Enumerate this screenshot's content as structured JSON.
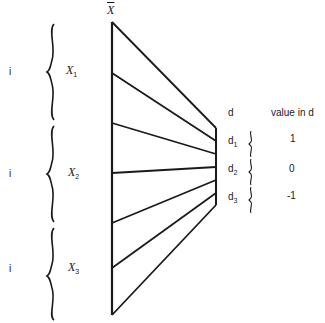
{
  "diagram": {
    "top_label": "X",
    "left_groups": [
      {
        "index_label": "i",
        "name": "X",
        "subscript": "1"
      },
      {
        "index_label": "i",
        "name": "X",
        "subscript": "2"
      },
      {
        "index_label": "i",
        "name": "X",
        "subscript": "3"
      }
    ],
    "right": {
      "header_d": "d",
      "header_value": "value in d",
      "rows": [
        {
          "name": "d",
          "subscript": "1",
          "value": "1"
        },
        {
          "name": "d",
          "subscript": "2",
          "value": "0"
        },
        {
          "name": "d",
          "subscript": "3",
          "value": "-1"
        }
      ]
    },
    "line_color": "#1a1a1a"
  }
}
